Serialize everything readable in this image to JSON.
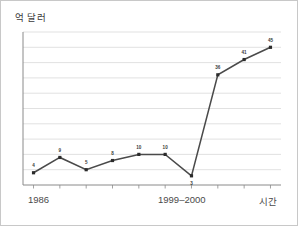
{
  "chart_data": {
    "type": "line",
    "title": "",
    "subtitle": "",
    "ylabel": "억 달러",
    "xlabel": "시간",
    "grid": true,
    "legend": false,
    "x": [
      0,
      1,
      2,
      3,
      4,
      5,
      6,
      7,
      8,
      9
    ],
    "values": [
      4,
      9,
      5,
      8,
      10,
      10,
      3,
      36,
      41,
      45
    ],
    "point_labels": [
      "4",
      "9",
      "5",
      "8",
      "10",
      "10",
      "3",
      "36",
      "41",
      "45"
    ],
    "label_positions": [
      "above",
      "above",
      "above",
      "above",
      "above",
      "above",
      "below",
      "above",
      "above",
      "above"
    ],
    "xtick_labels": [
      "1986",
      "1999–2000",
      "시간"
    ],
    "xtick_positions": [
      0.5,
      5.5,
      9.6
    ],
    "ylim": [
      0,
      50
    ],
    "xlim": [
      -0.4,
      9.4
    ],
    "gridline_values": [
      5,
      10,
      15,
      20,
      25,
      30,
      35,
      40,
      45,
      50
    ],
    "series_name": "",
    "colors": {
      "line": "#4a4a4a",
      "marker": "#2b2b2b",
      "grid": "#d9d9d9",
      "axis": "#8a8a8a",
      "label_text": "#3a3a3a",
      "background": "#ffffff",
      "border": "#c8c8c8"
    }
  },
  "axis": {
    "y_title": "억 달러",
    "x_title": "시간"
  }
}
